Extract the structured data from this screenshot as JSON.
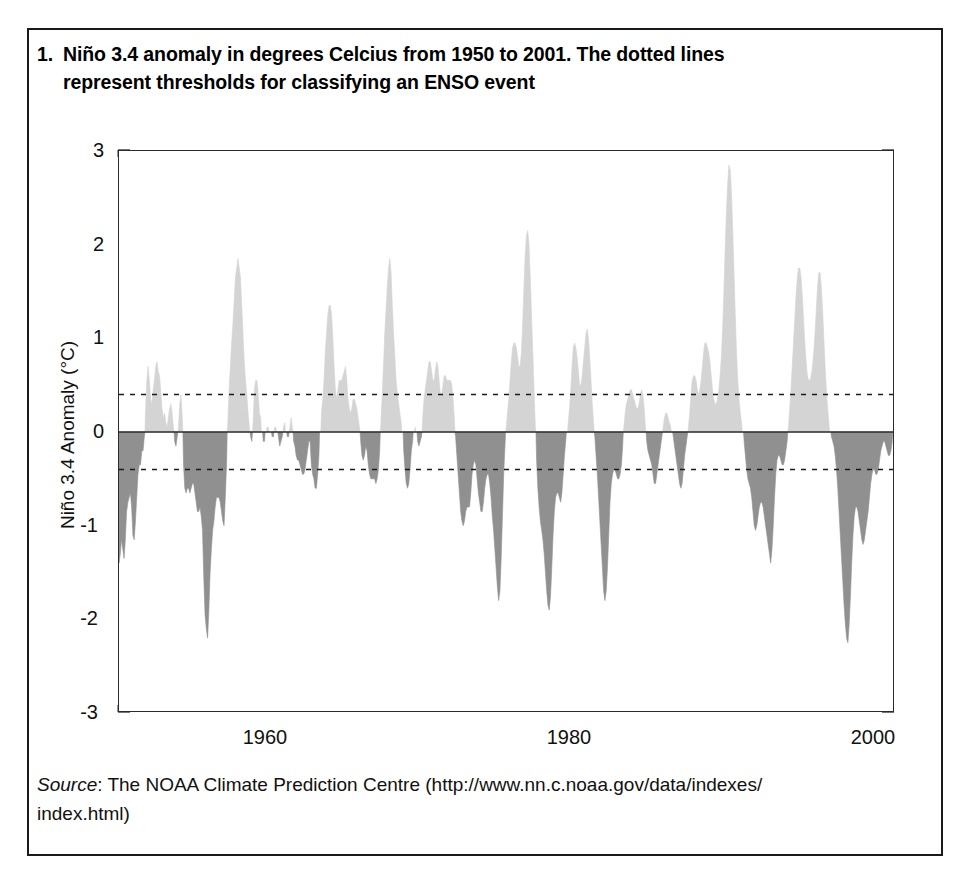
{
  "figure": {
    "number": "1.",
    "caption_line1": "Niño 3.4 anomaly in degrees Celcius from 1950 to 2001. The dotted lines",
    "caption_line2": "represent thresholds for classifying an ENSO event",
    "source_label": "Source",
    "source_sep": ": ",
    "source_line1": "The NOAA Climate Prediction Centre (http://www.nn.c.noaa.gov/data/indexes/",
    "source_line2": "index.html)"
  },
  "colors": {
    "positive_fill": "#d4d4d4",
    "negative_fill": "#909090",
    "axis": "#2b2b2b",
    "threshold_line": "#1a1a1a",
    "frame": "#1a1a1a",
    "text": "#111111",
    "background": "#ffffff"
  },
  "chart_data": {
    "type": "area",
    "title": "",
    "subtitle": "",
    "xlabel": "",
    "ylabel": "Niño 3.4 Anomaly (°C)",
    "xlim": [
      1950.0,
      2001.1
    ],
    "ylim": [
      -3,
      3
    ],
    "ytick_labels": [
      "3",
      "2",
      "1",
      "0",
      "-1",
      "-2",
      "-3"
    ],
    "yticks": [
      3,
      2,
      1,
      0,
      -1,
      -2,
      -3
    ],
    "y_minor_tick_step": 0.2,
    "xtick_labels": [
      "1960",
      "1980",
      "2000"
    ],
    "xticks": [
      1960,
      1980,
      2000
    ],
    "x_minor_tick_step": 2,
    "grid": false,
    "legend": "none",
    "thresholds": [
      {
        "name": "El Niño threshold",
        "value": 0.4,
        "style": "dotted"
      },
      {
        "name": "La Niña threshold",
        "value": -0.4,
        "style": "dotted"
      }
    ],
    "zero_line": 0,
    "series_name": "Niño 3.4 SST anomaly (monthly)",
    "x_start": 1950.0,
    "x_step": 0.08333,
    "values": [
      -1.4,
      -1.3,
      -1.15,
      -1.25,
      -1.35,
      -1.15,
      -0.85,
      -0.75,
      -0.7,
      -0.65,
      -0.8,
      -1.1,
      -1.15,
      -0.95,
      -0.7,
      -0.45,
      -0.35,
      -0.35,
      -0.2,
      -0.2,
      -0.05,
      0.25,
      0.55,
      0.7,
      0.55,
      0.35,
      0.3,
      0.45,
      0.55,
      0.7,
      0.75,
      0.65,
      0.6,
      0.45,
      0.25,
      0.15,
      0.2,
      0.1,
      0.05,
      0.15,
      0.25,
      0.3,
      0.2,
      0.05,
      -0.1,
      -0.15,
      -0.05,
      0.05,
      0.3,
      0.4,
      0.15,
      -0.35,
      -0.6,
      -0.65,
      -0.6,
      -0.6,
      -0.65,
      -0.6,
      -0.55,
      -0.55,
      -0.65,
      -0.75,
      -0.85,
      -0.85,
      -0.8,
      -0.9,
      -1.05,
      -1.55,
      -1.95,
      -2.1,
      -2.2,
      -1.9,
      -1.5,
      -1.25,
      -1.05,
      -0.95,
      -0.8,
      -0.7,
      -0.7,
      -0.7,
      -0.75,
      -0.85,
      -0.95,
      -1.0,
      -0.7,
      -0.35,
      0.1,
      0.45,
      0.7,
      0.95,
      1.15,
      1.4,
      1.65,
      1.75,
      1.85,
      1.75,
      1.65,
      1.35,
      1.05,
      0.75,
      0.55,
      0.4,
      0.2,
      0.05,
      -0.05,
      -0.1,
      0.1,
      0.45,
      0.55,
      0.55,
      0.4,
      0.2,
      0.15,
      0.0,
      -0.1,
      -0.1,
      0.0,
      0.05,
      0.05,
      0.0,
      0.0,
      -0.05,
      -0.05,
      0.05,
      0.05,
      0.0,
      -0.05,
      -0.15,
      -0.1,
      -0.05,
      0.05,
      0.1,
      0.0,
      -0.05,
      -0.05,
      0.05,
      0.15,
      0.05,
      -0.1,
      -0.15,
      -0.25,
      -0.3,
      -0.3,
      -0.35,
      -0.4,
      -0.45,
      -0.45,
      -0.4,
      -0.3,
      -0.2,
      -0.1,
      -0.1,
      -0.35,
      -0.45,
      -0.5,
      -0.6,
      -0.6,
      -0.45,
      -0.25,
      0.0,
      0.2,
      0.35,
      0.55,
      0.85,
      1.05,
      1.25,
      1.35,
      1.35,
      1.25,
      1.0,
      0.7,
      0.45,
      0.35,
      0.45,
      0.55,
      0.55,
      0.55,
      0.6,
      0.65,
      0.7,
      0.55,
      0.35,
      0.25,
      0.2,
      0.25,
      0.35,
      0.35,
      0.3,
      0.25,
      0.15,
      0.05,
      -0.1,
      -0.25,
      -0.3,
      -0.25,
      -0.15,
      -0.2,
      -0.35,
      -0.45,
      -0.5,
      -0.5,
      -0.5,
      -0.5,
      -0.55,
      -0.5,
      -0.4,
      -0.2,
      0.1,
      0.4,
      0.7,
      1.05,
      1.3,
      1.55,
      1.75,
      1.85,
      1.7,
      1.35,
      1.05,
      0.8,
      0.55,
      0.4,
      0.3,
      0.2,
      0.1,
      0.0,
      -0.2,
      -0.4,
      -0.55,
      -0.6,
      -0.55,
      -0.4,
      -0.2,
      -0.1,
      0.0,
      0.05,
      0.0,
      -0.1,
      -0.15,
      -0.1,
      -0.05,
      0.15,
      0.35,
      0.45,
      0.55,
      0.65,
      0.75,
      0.75,
      0.65,
      0.55,
      0.55,
      0.65,
      0.75,
      0.7,
      0.55,
      0.4,
      0.4,
      0.5,
      0.6,
      0.6,
      0.55,
      0.55,
      0.55,
      0.55,
      0.5,
      0.35,
      0.15,
      -0.05,
      -0.25,
      -0.45,
      -0.65,
      -0.85,
      -0.95,
      -1.0,
      -0.95,
      -0.85,
      -0.8,
      -0.8,
      -0.8,
      -0.65,
      -0.45,
      -0.35,
      -0.3,
      -0.35,
      -0.5,
      -0.65,
      -0.75,
      -0.85,
      -0.85,
      -0.75,
      -0.6,
      -0.5,
      -0.45,
      -0.45,
      -0.55,
      -0.7,
      -0.9,
      -1.05,
      -1.25,
      -1.45,
      -1.65,
      -1.8,
      -1.7,
      -1.35,
      -0.9,
      -0.45,
      -0.15,
      0.05,
      0.2,
      0.35,
      0.55,
      0.75,
      0.9,
      0.95,
      0.95,
      0.9,
      0.8,
      0.7,
      0.7,
      0.85,
      1.15,
      1.55,
      1.9,
      2.1,
      2.15,
      2.0,
      1.65,
      1.25,
      0.85,
      0.45,
      0.05,
      -0.3,
      -0.6,
      -0.8,
      -0.95,
      -1.05,
      -1.15,
      -1.3,
      -1.5,
      -1.7,
      -1.85,
      -1.9,
      -1.75,
      -1.45,
      -1.1,
      -0.85,
      -0.7,
      -0.65,
      -0.65,
      -0.7,
      -0.75,
      -0.65,
      -0.45,
      -0.25,
      -0.1,
      0.0,
      0.1,
      0.25,
      0.45,
      0.7,
      0.9,
      0.95,
      0.9,
      0.8,
      0.65,
      0.5,
      0.5,
      0.6,
      0.75,
      0.9,
      1.05,
      1.1,
      1.0,
      0.8,
      0.55,
      0.3,
      0.1,
      -0.05,
      -0.25,
      -0.45,
      -0.7,
      -0.95,
      -1.2,
      -1.45,
      -1.7,
      -1.8,
      -1.7,
      -1.45,
      -1.1,
      -0.75,
      -0.55,
      -0.45,
      -0.4,
      -0.4,
      -0.45,
      -0.5,
      -0.5,
      -0.45,
      -0.35,
      -0.15,
      0.05,
      0.2,
      0.3,
      0.35,
      0.4,
      0.45,
      0.45,
      0.4,
      0.35,
      0.3,
      0.25,
      0.25,
      0.3,
      0.4,
      0.45,
      0.4,
      0.25,
      0.05,
      -0.1,
      -0.2,
      -0.25,
      -0.3,
      -0.35,
      -0.45,
      -0.55,
      -0.55,
      -0.45,
      -0.35,
      -0.25,
      -0.15,
      -0.05,
      0.05,
      0.15,
      0.2,
      0.2,
      0.15,
      0.1,
      0.05,
      0.0,
      -0.05,
      -0.15,
      -0.25,
      -0.35,
      -0.45,
      -0.55,
      -0.6,
      -0.55,
      -0.4,
      -0.25,
      -0.15,
      -0.05,
      0.05,
      0.2,
      0.4,
      0.55,
      0.6,
      0.6,
      0.55,
      0.45,
      0.4,
      0.45,
      0.55,
      0.7,
      0.85,
      0.95,
      0.95,
      0.9,
      0.85,
      0.75,
      0.6,
      0.45,
      0.35,
      0.3,
      0.3,
      0.35,
      0.45,
      0.6,
      0.8,
      1.1,
      1.5,
      1.95,
      2.35,
      2.65,
      2.85,
      2.8,
      2.55,
      2.15,
      1.7,
      1.25,
      0.85,
      0.55,
      0.35,
      0.2,
      0.1,
      0.0,
      -0.1,
      -0.25,
      -0.4,
      -0.5,
      -0.55,
      -0.6,
      -0.7,
      -0.85,
      -1.0,
      -1.05,
      -1.0,
      -0.9,
      -0.8,
      -0.75,
      -0.75,
      -0.8,
      -0.9,
      -1.0,
      -1.1,
      -1.2,
      -1.3,
      -1.4,
      -1.25,
      -1.0,
      -0.7,
      -0.45,
      -0.3,
      -0.25,
      -0.25,
      -0.3,
      -0.35,
      -0.35,
      -0.3,
      -0.2,
      -0.1,
      0.05,
      0.25,
      0.45,
      0.7,
      0.95,
      1.2,
      1.45,
      1.65,
      1.75,
      1.75,
      1.65,
      1.45,
      1.2,
      0.95,
      0.75,
      0.6,
      0.55,
      0.55,
      0.6,
      0.7,
      0.85,
      1.05,
      1.3,
      1.55,
      1.7,
      1.7,
      1.55,
      1.3,
      1.0,
      0.7,
      0.45,
      0.25,
      0.1,
      0.0,
      -0.05,
      -0.1,
      -0.15,
      -0.25,
      -0.4,
      -0.6,
      -0.85,
      -1.1,
      -1.35,
      -1.6,
      -1.85,
      -2.05,
      -2.2,
      -2.25,
      -2.05,
      -1.75,
      -1.4,
      -1.1,
      -0.9,
      -0.8,
      -0.8,
      -0.85,
      -0.95,
      -1.05,
      -1.15,
      -1.2,
      -1.15,
      -1.05,
      -0.95,
      -0.85,
      -0.7,
      -0.55,
      -0.45,
      -0.4,
      -0.4,
      -0.45,
      -0.45,
      -0.4,
      -0.3,
      -0.2,
      -0.15,
      -0.1,
      -0.1,
      -0.15,
      -0.2,
      -0.25,
      -0.25,
      -0.2,
      -0.1,
      0.05,
      0.25,
      0.45,
      0.65,
      0.85,
      1.05,
      1.25,
      1.45,
      1.6,
      1.7,
      1.75,
      1.7,
      1.55,
      1.3,
      1.0,
      0.7,
      0.45,
      0.3,
      0.25,
      0.3,
      0.35,
      0.4,
      0.4,
      0.35,
      0.25,
      0.15,
      0.05,
      -0.05,
      -0.15,
      -0.25,
      -0.35,
      -0.4,
      -0.35,
      -0.25,
      -0.15,
      -0.05,
      0.05,
      0.15,
      0.25,
      0.35,
      0.45,
      0.55,
      0.6,
      0.6,
      0.55,
      0.5,
      0.45,
      0.4,
      0.3,
      0.2,
      0.1,
      0.05,
      0.05,
      0.1,
      0.2,
      0.35,
      0.55,
      0.75,
      0.85,
      0.85,
      0.75,
      0.6,
      0.45,
      0.3,
      0.2,
      0.15,
      0.15,
      0.2,
      0.3,
      0.4,
      0.45,
      0.45,
      0.35,
      0.2,
      0.05,
      -0.1,
      -0.25,
      -0.35,
      -0.45,
      -0.5,
      -0.5,
      -0.45,
      -0.35,
      -0.25,
      -0.15,
      -0.05,
      0.1,
      0.3,
      0.55,
      0.85,
      1.2,
      1.6,
      2.0,
      2.35,
      2.6,
      2.8,
      2.85,
      2.7,
      2.35,
      1.85,
      1.25,
      0.65,
      0.1,
      -0.35,
      -0.7,
      -0.95,
      -1.15,
      -1.3,
      -1.45,
      -1.5,
      -1.45,
      -1.3,
      -1.1,
      -0.95,
      -0.95,
      -1.0,
      -1.05,
      -1.1,
      -1.15,
      -1.2,
      -1.25,
      -1.2,
      -1.1,
      -0.95,
      -0.8,
      -0.7,
      -0.6,
      -0.5,
      -0.45,
      -0.45,
      -0.55,
      -0.7,
      -0.8,
      -0.8,
      -0.7,
      -0.55,
      -0.45,
      -0.35,
      -0.25,
      -0.2,
      -0.2,
      -0.25,
      -0.3,
      -0.35,
      -0.4
    ]
  }
}
